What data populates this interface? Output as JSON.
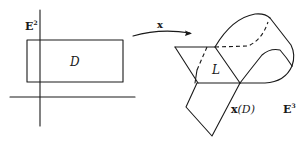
{
  "left_panel": {
    "space_label": "E",
    "space_exponent": "2",
    "region_label": "D"
  },
  "mapping": {
    "label": "x"
  },
  "right_panel": {
    "line_label": "L",
    "image_label_prefix": "x",
    "image_label_arg": "(D)",
    "space_label": "E",
    "space_exponent": "3"
  },
  "colors": {
    "ink": "#1a1a1a",
    "background": "#ffffff"
  }
}
